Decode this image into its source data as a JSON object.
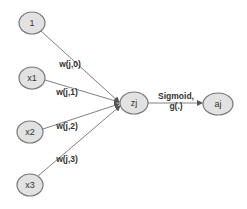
{
  "diagram": {
    "type": "neural-network-neuron",
    "colors": {
      "background": "#ffffff",
      "node_fill": "#e2e2e2",
      "node_stroke": "#777777",
      "edge": "#808080",
      "text": "#333333"
    },
    "nodes": [
      {
        "id": "n1",
        "label": "1",
        "cx": 32,
        "cy": 23,
        "rx": 13,
        "ry": 11
      },
      {
        "id": "x1",
        "label": "x1",
        "cx": 32,
        "cy": 78,
        "rx": 13,
        "ry": 11
      },
      {
        "id": "x2",
        "label": "x2",
        "cx": 30,
        "cy": 132,
        "rx": 13,
        "ry": 11
      },
      {
        "id": "x3",
        "label": "x3",
        "cx": 30,
        "cy": 185,
        "rx": 13,
        "ry": 11
      },
      {
        "id": "zj",
        "label": "zj",
        "cx": 134,
        "cy": 103,
        "rx": 14,
        "ry": 11
      },
      {
        "id": "aj",
        "label": "aj",
        "cx": 218,
        "cy": 104,
        "rx": 15,
        "ry": 11
      }
    ],
    "edges": [
      {
        "from": "n1",
        "to": "zj",
        "label": "w(j,0)",
        "lx": 70,
        "ly": 67
      },
      {
        "from": "x1",
        "to": "zj",
        "label": "w(j,1)",
        "lx": 67,
        "ly": 95
      },
      {
        "from": "x2",
        "to": "zj",
        "label": "w(j,2)",
        "lx": 67,
        "ly": 129
      },
      {
        "from": "x3",
        "to": "zj",
        "label": "w(j,3)",
        "lx": 67,
        "ly": 162
      },
      {
        "from": "zj",
        "to": "aj",
        "label": "Sigmoid,",
        "sublabel": "g(.)"
      }
    ],
    "activation": {
      "label": "Sigmoid,",
      "sublabel": "g(.)"
    }
  }
}
